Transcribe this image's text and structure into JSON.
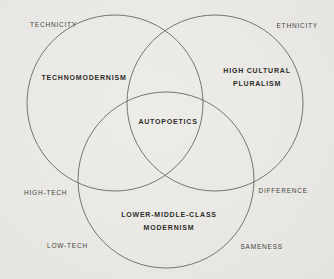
{
  "diagram": {
    "type": "venn",
    "colors": {
      "background": "#e9e8e4",
      "circle_stroke": "#757473",
      "inner_text": "#2e2d2b",
      "outer_text": "#454441"
    },
    "sets": {
      "top_left_circle": {
        "label": "TECHNOMODERNISM"
      },
      "top_right_circle": {
        "label_line1": "HIGH CULTURAL",
        "label_line2": "PLURALISM"
      },
      "bottom_circle": {
        "label_line1": "LOWER-MIDDLE-CLASS",
        "label_line2": "MODERNISM"
      },
      "triple_intersection": {
        "label": "AUTOPOETICS"
      }
    },
    "outer_labels": {
      "top_left": "TECHNICITY",
      "top_right": "ETHNICITY",
      "mid_left": "HIGH-TECH",
      "mid_right": "DIFFERENCE",
      "bottom_left": "LOW-TECH",
      "bottom_right": "SAMENESS"
    }
  }
}
